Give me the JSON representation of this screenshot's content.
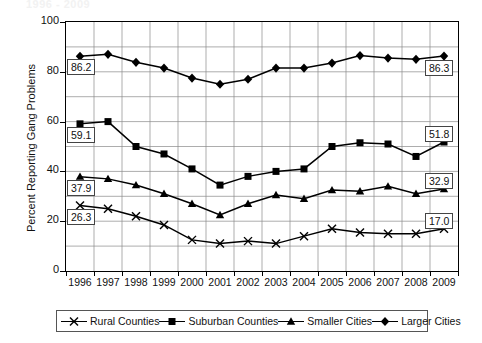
{
  "title_partial": "1996 - 2009",
  "axes": {
    "ylabel": "Percent Reporting Gang Problems",
    "xlabel": "",
    "yticks": [
      "0",
      "20",
      "40",
      "60",
      "80",
      "100"
    ],
    "ylim": [
      0,
      100
    ]
  },
  "legend": {
    "items": [
      {
        "label": "Rural Counties",
        "marker": "x-marker",
        "color": "#000000"
      },
      {
        "label": "Suburban Counties",
        "marker": "square-marker",
        "color": "#000000"
      },
      {
        "label": "Smaller Cities",
        "marker": "triangle-marker",
        "color": "#000000"
      },
      {
        "label": "Larger Cities",
        "marker": "diamond-marker",
        "color": "#000000"
      }
    ]
  },
  "callouts": {
    "left": [
      {
        "value": "86.2",
        "series": "Larger Cities"
      },
      {
        "value": "59.1",
        "series": "Suburban Counties"
      },
      {
        "value": "37.9",
        "series": "Smaller Cities"
      },
      {
        "value": "26.3",
        "series": "Rural Counties"
      }
    ],
    "right": [
      {
        "value": "86.3",
        "series": "Larger Cities"
      },
      {
        "value": "51.8",
        "series": "Suburban Counties"
      },
      {
        "value": "32.9",
        "series": "Smaller Cities"
      },
      {
        "value": "17.0",
        "series": "Rural Counties"
      }
    ]
  },
  "chart_data": {
    "type": "line",
    "title": "1996 - 2009",
    "xlabel": "",
    "ylabel": "Percent Reporting Gang Problems",
    "ylim": [
      0,
      100
    ],
    "grid": true,
    "legend_position": "bottom",
    "categories": [
      "1996",
      "1997",
      "1998",
      "1999",
      "2000",
      "2001",
      "2002",
      "2003",
      "2004",
      "2005",
      "2006",
      "2007",
      "2008",
      "2009"
    ],
    "series": [
      {
        "name": "Larger Cities",
        "marker": "diamond",
        "values": [
          86.2,
          87.0,
          83.8,
          81.5,
          77.5,
          75.0,
          77.0,
          81.5,
          81.5,
          83.5,
          86.5,
          85.5,
          85.0,
          86.3
        ],
        "first_label": "86.2",
        "last_label": "86.3"
      },
      {
        "name": "Suburban Counties",
        "marker": "square",
        "values": [
          59.1,
          60.0,
          50.0,
          47.0,
          41.0,
          34.5,
          38.0,
          40.0,
          41.0,
          50.0,
          51.5,
          51.0,
          46.0,
          51.8
        ],
        "first_label": "59.1",
        "last_label": "51.8"
      },
      {
        "name": "Smaller Cities",
        "marker": "triangle",
        "values": [
          37.9,
          37.0,
          34.5,
          31.0,
          27.0,
          22.5,
          27.0,
          30.5,
          29.0,
          32.5,
          32.0,
          34.0,
          31.0,
          32.9
        ],
        "first_label": "37.9",
        "last_label": "32.9"
      },
      {
        "name": "Rural Counties",
        "marker": "x",
        "values": [
          26.3,
          25.0,
          22.0,
          18.5,
          12.5,
          11.0,
          12.0,
          11.0,
          14.0,
          17.0,
          15.5,
          15.0,
          15.0,
          17.0
        ],
        "first_label": "26.3",
        "last_label": "17.0"
      }
    ]
  }
}
